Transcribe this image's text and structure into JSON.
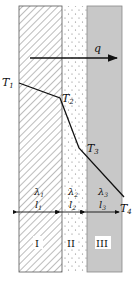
{
  "diagram": {
    "heat_flux_label": "q",
    "temperatures": [
      {
        "label": "T",
        "sub": "1"
      },
      {
        "label": "T",
        "sub": "2"
      },
      {
        "label": "T",
        "sub": "3"
      },
      {
        "label": "T",
        "sub": "4"
      }
    ],
    "layers": [
      {
        "numeral": "I",
        "conductivity": "λ",
        "conductivity_sub": "1",
        "thickness": "l",
        "thickness_sub": "1",
        "fill": "hatched"
      },
      {
        "numeral": "II",
        "conductivity": "λ",
        "conductivity_sub": "2",
        "thickness": "l",
        "thickness_sub": "2",
        "fill": "dotted"
      },
      {
        "numeral": "III",
        "conductivity": "λ",
        "conductivity_sub": "3",
        "thickness": "l",
        "thickness_sub": "3",
        "fill": "gray"
      }
    ],
    "colors": {
      "layer3_gray": "#c8c8c8",
      "line": "#111111"
    }
  }
}
